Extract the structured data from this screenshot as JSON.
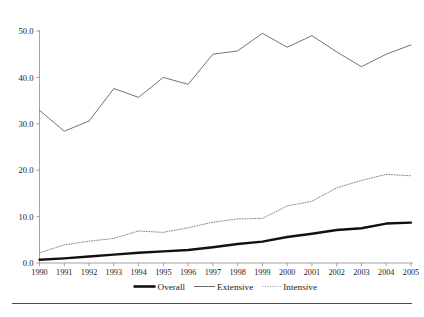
{
  "chart_data": {
    "type": "line",
    "title": "",
    "subtitle": "",
    "xlabel": "",
    "ylabel": "",
    "grid": false,
    "legend_position": "bottom",
    "categories": [
      "1990",
      "1991",
      "1992",
      "1993",
      "1994",
      "1995",
      "1996",
      "1997",
      "1998",
      "1999",
      "2000",
      "2001",
      "2002",
      "2003",
      "2004",
      "2005"
    ],
    "x": [
      1990,
      1991,
      1992,
      1993,
      1994,
      1995,
      1996,
      1997,
      1998,
      1999,
      2000,
      2001,
      2002,
      2003,
      2004,
      2005
    ],
    "xlim": [
      1990,
      2005
    ],
    "ylim": [
      0.0,
      50.0
    ],
    "yticks": [
      0.0,
      10.0,
      20.0,
      30.0,
      40.0,
      50.0
    ],
    "ytick_labels": [
      "0.0",
      "10.0",
      "20.0",
      "30.0",
      "40.0",
      "50.0"
    ],
    "xtick_labels": [
      "1990",
      "1991",
      "1992",
      "1993",
      "1994",
      "1995",
      "1996",
      "1997",
      "1998",
      "1999",
      "2000",
      "2001",
      "2002",
      "2003",
      "2004",
      "2005"
    ],
    "series": [
      {
        "name": "Overall",
        "style": "solid-thick",
        "color": "#111111",
        "values": [
          0.7,
          1.0,
          1.4,
          1.8,
          2.2,
          2.5,
          2.8,
          3.4,
          4.1,
          4.6,
          5.6,
          6.3,
          7.1,
          7.5,
          8.5,
          8.7
        ]
      },
      {
        "name": "Extensive",
        "style": "solid-thin",
        "color": "#5b5b5b",
        "values": [
          32.9,
          28.4,
          30.6,
          37.6,
          35.7,
          40.0,
          38.5,
          45.0,
          45.7,
          49.5,
          46.5,
          49.0,
          45.5,
          42.3,
          45.0,
          47.0
        ]
      },
      {
        "name": "Intensive",
        "style": "dotted",
        "color": "#7a7a7a",
        "values": [
          2.2,
          3.9,
          4.7,
          5.3,
          6.9,
          6.6,
          7.6,
          8.8,
          9.5,
          9.6,
          12.3,
          13.3,
          16.2,
          17.8,
          19.1,
          18.8
        ]
      }
    ],
    "legend": [
      {
        "label": "Overall",
        "style": "solid-thick",
        "color": "#111111"
      },
      {
        "label": "Extensive",
        "style": "solid-thin",
        "color": "#5b5b5b"
      },
      {
        "label": "Intensive",
        "style": "dotted",
        "color": "#8a8a8a"
      }
    ]
  },
  "footer": {
    "rule_color": "#4c4c4c",
    "note_fragment": ""
  }
}
